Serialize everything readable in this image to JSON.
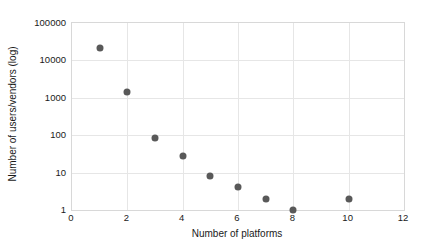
{
  "chart_data": {
    "type": "scatter",
    "title": "",
    "xlabel": "Number of platforms",
    "ylabel": "Number of users/vendors (log)",
    "xlim": [
      0,
      12
    ],
    "ylim": [
      1,
      100000
    ],
    "yscale": "log",
    "xscale": "linear",
    "grid": true,
    "legend": "none",
    "xticks": [
      "0",
      "2",
      "4",
      "6",
      "8",
      "10",
      "12"
    ],
    "xtick_values": [
      0,
      2,
      4,
      6,
      8,
      10,
      12
    ],
    "yticks": [
      "1",
      "10",
      "100",
      "1000",
      "10000",
      "100000"
    ],
    "ytick_values": [
      1,
      10,
      100,
      1000,
      10000,
      100000
    ],
    "x": [
      1,
      2,
      3,
      4,
      5,
      6,
      7,
      8,
      10
    ],
    "values": [
      21000,
      1400,
      85,
      28,
      8,
      4,
      2,
      1,
      2
    ],
    "series": [
      {
        "name": "users/vendors per platform count",
        "x": [
          1,
          2,
          3,
          4,
          5,
          6,
          7,
          8,
          10
        ],
        "values": [
          21000,
          1400,
          85,
          28,
          8,
          4,
          2,
          1,
          2
        ]
      }
    ],
    "marker": "circle",
    "marker_color": "#595959",
    "grid_color": "#e6e6e6",
    "axis_color": "#d8d8d8",
    "background_color": "#ffffff",
    "text_color": "#1a1a1a"
  }
}
